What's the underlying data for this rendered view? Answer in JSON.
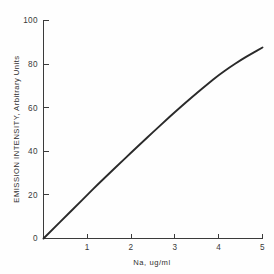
{
  "chart_data": {
    "type": "line",
    "title": "",
    "subtitle": "",
    "xlabel": "Na, ug/ml",
    "ylabel": "EMISSION INTENSITY, Arbitrary Units",
    "xlim": [
      0,
      5
    ],
    "ylim": [
      0,
      100
    ],
    "xticks": [
      0,
      1,
      2,
      3,
      4,
      5
    ],
    "xticklabels": [
      "",
      "1",
      "2",
      "3",
      "4",
      "5"
    ],
    "yticks": [
      0,
      20,
      40,
      60,
      80,
      100
    ],
    "yticklabels": [
      "0",
      "20",
      "40",
      "60",
      "80",
      "100"
    ],
    "grid": false,
    "legend": false,
    "legend_position": "none",
    "line_color": "#2a2a2a",
    "axis_color": "#3b3b3b",
    "background_color": "#fefefe",
    "series": [
      {
        "name": "Sodium emission calibration",
        "x": [
          0.0,
          0.25,
          0.5,
          0.75,
          1.0,
          1.25,
          1.5,
          1.75,
          2.0,
          2.25,
          2.5,
          2.75,
          3.0,
          3.25,
          3.5,
          3.75,
          4.0,
          4.25,
          4.5,
          4.75,
          5.0
        ],
        "values": [
          0.0,
          5.0,
          10.0,
          15.0,
          20.0,
          25.0,
          29.8,
          34.6,
          39.4,
          44.1,
          48.8,
          53.4,
          58.0,
          62.4,
          66.7,
          70.9,
          75.0,
          78.5,
          81.8,
          84.8,
          87.6
        ]
      }
    ]
  },
  "axes": {
    "y_tick_0": "0",
    "y_tick_20": "20",
    "y_tick_40": "40",
    "y_tick_60": "60",
    "y_tick_80": "80",
    "y_tick_100": "100",
    "x_tick_1": "1",
    "x_tick_2": "2",
    "x_tick_3": "3",
    "x_tick_4": "4",
    "x_tick_5": "5",
    "x_axis_title": "Na, ug/ml",
    "y_axis_title": "EMISSION INTENSITY, Arbitrary Units"
  }
}
